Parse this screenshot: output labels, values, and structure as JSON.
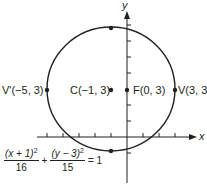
{
  "axes": {
    "x_label": "x",
    "y_label": "y",
    "unit_px": 16,
    "origin_px": [
      127,
      137
    ]
  },
  "ellipse": {
    "center": [
      -1,
      3
    ],
    "a": 4,
    "b": 3.873,
    "color": "#231f20"
  },
  "points": [
    {
      "id": "V_prime",
      "label": "V'(−5, 3)",
      "coords": [
        -5,
        3
      ]
    },
    {
      "id": "C",
      "label": "C(−1, 3)",
      "coords": [
        -1,
        3
      ]
    },
    {
      "id": "F",
      "label": "F(0, 3)",
      "coords": [
        0,
        3
      ]
    },
    {
      "id": "V",
      "label": "V(3, 3)",
      "coords": [
        3,
        3
      ]
    },
    {
      "id": "top",
      "label": "",
      "coords": [
        -1,
        6.873
      ]
    },
    {
      "id": "bottom",
      "label": "",
      "coords": [
        -1,
        -0.873
      ]
    }
  ],
  "equation": {
    "term1_num": "(x + 1)",
    "term1_den": "16",
    "term2_num": "(y − 3)",
    "term2_den": "15",
    "plus": "+",
    "exp": "2",
    "rhs": "= 1"
  }
}
